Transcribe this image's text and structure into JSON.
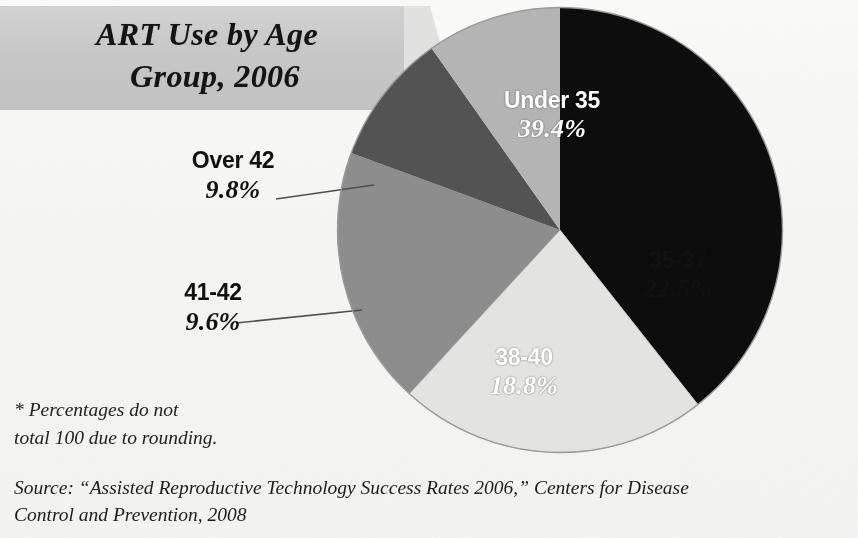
{
  "title": {
    "line1": "ART Use by Age",
    "line2": "Group, 2006"
  },
  "footnote": {
    "line1": "* Percentages do not",
    "line2": "total 100 due to rounding."
  },
  "source": {
    "line1": "Source: “Assisted Reproductive Technology Success Rates 2006,” Centers for Disease",
    "line2": "Control and Prevention, 2008"
  },
  "chart_data": {
    "type": "pie",
    "title": "ART Use by Age Group, 2006",
    "categories": [
      "Under 35",
      "35-37",
      "38-40",
      "41-42",
      "Over 42"
    ],
    "values": [
      39.4,
      22.5,
      18.8,
      9.6,
      9.8
    ],
    "value_labels": [
      "39.4%",
      "22.5%",
      "18.8%",
      "9.6%",
      "9.8%"
    ],
    "unit": "percent",
    "total": 100.1,
    "note": "* Percentages do not total 100 due to rounding.",
    "legend": "none (slices labelled directly)",
    "start_angle_deg": 0,
    "direction": "clockwise",
    "slice_colors": [
      "#0d0d0d",
      "#e3e3e1",
      "#8d8d8d",
      "#535353",
      "#b4b4b4"
    ],
    "slices": [
      {
        "label": "Under 35",
        "value": 39.4,
        "value_label": "39.4%",
        "color": "#0d0d0d",
        "label_placement": "inside",
        "label_color": "#ffffff"
      },
      {
        "label": "35-37",
        "value": 22.5,
        "value_label": "22.5%",
        "color": "#e3e3e1",
        "label_placement": "inside",
        "label_color": "#111111"
      },
      {
        "label": "38-40",
        "value": 18.8,
        "value_label": "18.8%",
        "color": "#8d8d8d",
        "label_placement": "inside",
        "label_color": "#ffffff"
      },
      {
        "label": "41-42",
        "value": 9.6,
        "value_label": "9.6%",
        "color": "#535353",
        "label_placement": "outside-left",
        "label_color": "#111111"
      },
      {
        "label": "Over 42",
        "value": 9.8,
        "value_label": "9.8%",
        "color": "#b4b4b4",
        "label_placement": "outside-left",
        "label_color": "#111111"
      }
    ]
  },
  "colors": {
    "paper": "#f8f8f6",
    "title_band": "#c8c8c8",
    "pie_outline": "#8a8a8a",
    "leader_line": "#555555",
    "text": "#111111"
  }
}
